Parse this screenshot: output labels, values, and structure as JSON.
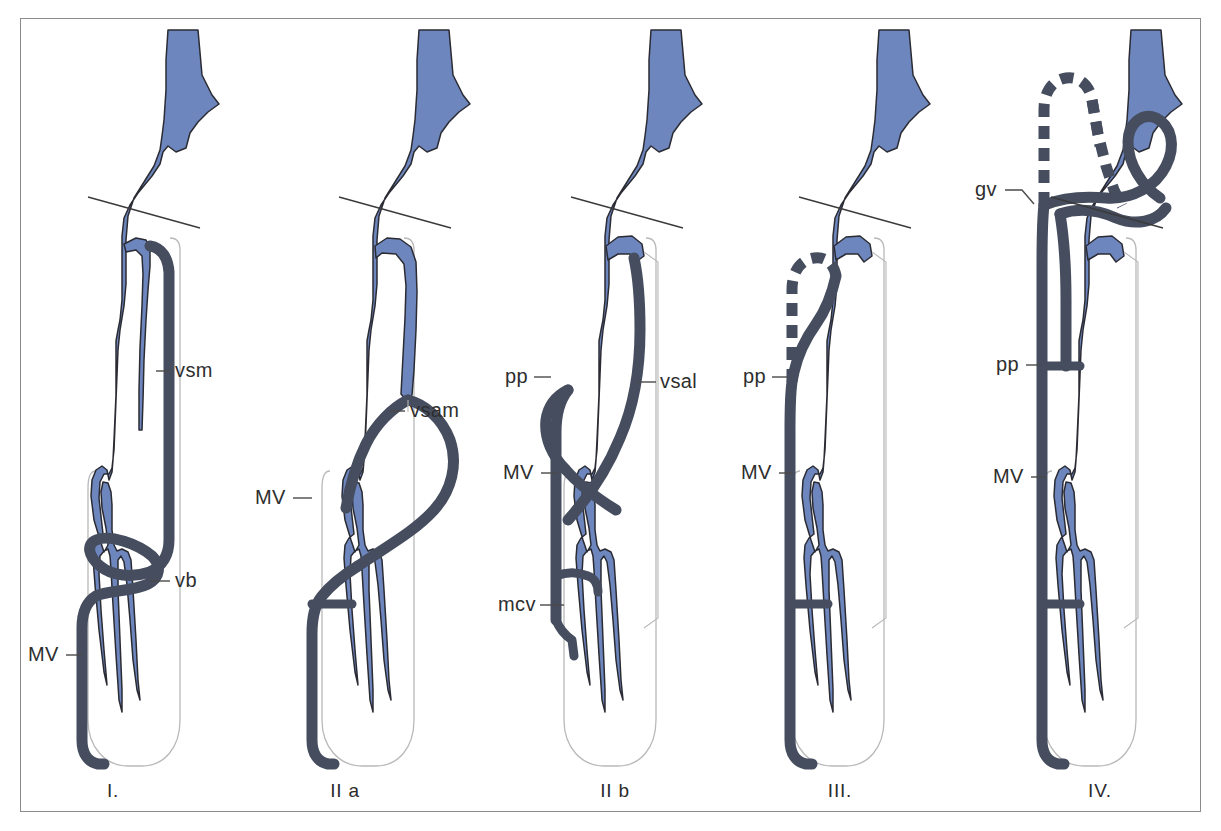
{
  "figure": {
    "frame_color": "#8b8b8b",
    "background": "#ffffff",
    "colors": {
      "deep_vein_blue": "#6d86bd",
      "superficial_vein_dark": "#454d5e",
      "leg_outline": "#b9b9b9",
      "label_text": "#2e2e2e",
      "leader_line": "#4a4a4a"
    }
  },
  "panels": [
    {
      "id": "panel-1",
      "caption": "I.",
      "caption_x": 113,
      "caption_y": 797,
      "labels": [
        {
          "key": "vsm",
          "text": "vsm",
          "x": 175,
          "y": 377
        },
        {
          "key": "vb",
          "text": "vb",
          "x": 175,
          "y": 587
        },
        {
          "key": "mv",
          "text": "MV",
          "x": 28,
          "y": 661
        }
      ]
    },
    {
      "id": "panel-2a",
      "caption": "II a",
      "caption_x": 345,
      "caption_y": 797,
      "labels": [
        {
          "key": "vsam",
          "text": "vsam",
          "x": 410,
          "y": 417
        },
        {
          "key": "mv",
          "text": "MV",
          "x": 255,
          "y": 504
        }
      ]
    },
    {
      "id": "panel-2b",
      "caption": "II b",
      "caption_x": 615,
      "caption_y": 797,
      "labels": [
        {
          "key": "pp",
          "text": "pp",
          "x": 505,
          "y": 383
        },
        {
          "key": "vsal",
          "text": "vsal",
          "x": 660,
          "y": 388
        },
        {
          "key": "mv",
          "text": "MV",
          "x": 503,
          "y": 479
        },
        {
          "key": "mcv",
          "text": "mcv",
          "x": 498,
          "y": 611
        }
      ]
    },
    {
      "id": "panel-3",
      "caption": "III.",
      "caption_x": 840,
      "caption_y": 797,
      "labels": [
        {
          "key": "pp",
          "text": "pp",
          "x": 743,
          "y": 383
        },
        {
          "key": "mv",
          "text": "MV",
          "x": 741,
          "y": 479
        }
      ]
    },
    {
      "id": "panel-4",
      "caption": "IV.",
      "caption_x": 1100,
      "caption_y": 797,
      "labels": [
        {
          "key": "gv",
          "text": "gv",
          "x": 975,
          "y": 196
        },
        {
          "key": "pp",
          "text": "pp",
          "x": 996,
          "y": 371
        },
        {
          "key": "mv",
          "text": "MV",
          "x": 993,
          "y": 483
        }
      ]
    }
  ],
  "legend_terms": [
    {
      "abbr": "vsm",
      "meaning": "vena saphena magna"
    },
    {
      "abbr": "vsam",
      "meaning": "vena saphena accessoria medialis"
    },
    {
      "abbr": "vsal",
      "meaning": "vena saphena accessoria lateralis"
    },
    {
      "abbr": "vb",
      "meaning": "vena Boyd"
    },
    {
      "abbr": "mcv",
      "meaning": "vena communicans"
    },
    {
      "abbr": "pp",
      "meaning": "perforator proximal"
    },
    {
      "abbr": "gv",
      "meaning": "gabelvene"
    },
    {
      "abbr": "MV",
      "meaning": "Markierungsvene"
    }
  ]
}
